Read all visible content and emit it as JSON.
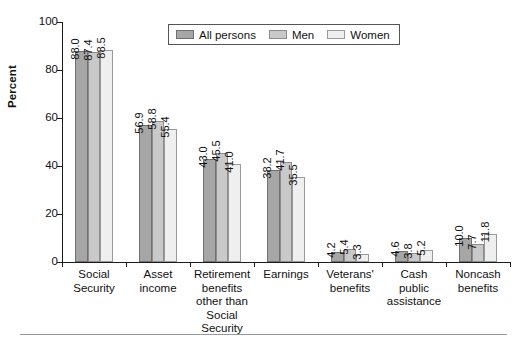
{
  "chart_data": {
    "type": "bar",
    "title": "",
    "subtitle": "",
    "xlabel": "",
    "ylabel": "Percent",
    "ylim": [
      0,
      100
    ],
    "yticks": [
      0,
      20,
      40,
      60,
      80,
      100
    ],
    "ytick_labels": [
      "0",
      "20",
      "40",
      "60",
      "80",
      "100"
    ],
    "grid": false,
    "legend_position": "top-center",
    "value_label_rotation": 90,
    "categories": [
      "Social Security",
      "Asset income",
      "Retirement benefits other than Social Security",
      "Earnings",
      "Veterans' benefits",
      "Cash public assistance",
      "Noncash benefits"
    ],
    "category_label_lines": [
      [
        "Social",
        "Security"
      ],
      [
        "Asset",
        "income"
      ],
      [
        "Retirement",
        "benefits",
        "other than",
        "Social Security"
      ],
      [
        "Earnings"
      ],
      [
        "Veterans'",
        "benefits"
      ],
      [
        "Cash",
        "public",
        "assistance"
      ],
      [
        "Noncash",
        "benefits"
      ]
    ],
    "series": [
      {
        "name": "All persons",
        "color": "#a6a6a6",
        "values": [
          88.0,
          56.9,
          43.0,
          38.2,
          4.2,
          4.6,
          10.0
        ],
        "value_labels": [
          "88.0",
          "56.9",
          "43.0",
          "38.2",
          "4.2",
          "4.6",
          "10.0"
        ]
      },
      {
        "name": "Men",
        "color": "#c9c9c9",
        "values": [
          87.4,
          58.8,
          45.5,
          41.7,
          5.4,
          3.8,
          7.7
        ],
        "value_labels": [
          "87.4",
          "58.8",
          "45.5",
          "41.7",
          "5.4",
          "3.8",
          "7.7"
        ]
      },
      {
        "name": "Women",
        "color": "#efefef",
        "values": [
          88.5,
          55.4,
          41.0,
          35.5,
          3.3,
          5.2,
          11.8
        ],
        "value_labels": [
          "88.5",
          "55.4",
          "41.0",
          "35.5",
          "3.3",
          "5.2",
          "11.8"
        ]
      }
    ]
  },
  "legend": {
    "items": [
      {
        "label": "All persons",
        "swatch": "s0"
      },
      {
        "label": "Men",
        "swatch": "s1"
      },
      {
        "label": "Women",
        "swatch": "s2"
      }
    ]
  },
  "axis": {
    "y_title": "Percent"
  }
}
